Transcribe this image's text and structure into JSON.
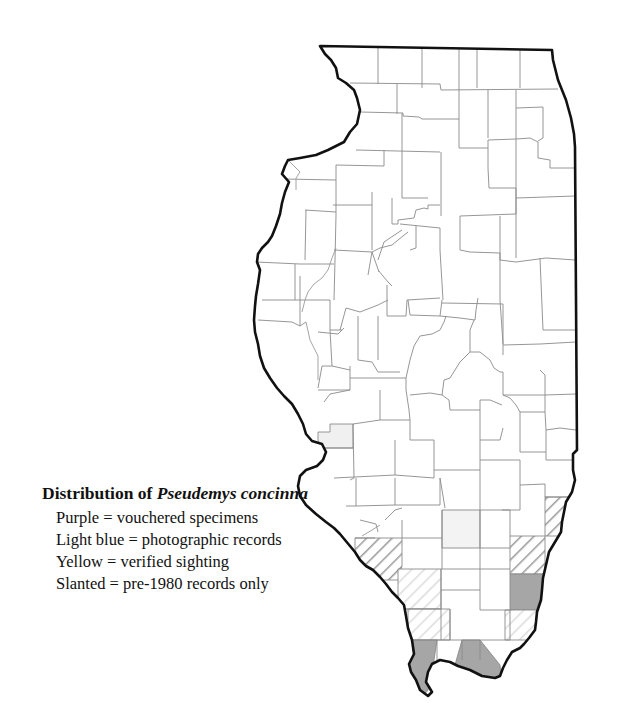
{
  "legend": {
    "title_prefix": "Distribution of ",
    "title_species": "Pseudemys concinna",
    "items": [
      {
        "label": "Purple = vouchered specimens"
      },
      {
        "label": "Light blue = photographic records"
      },
      {
        "label": "Yellow = verified sighting"
      },
      {
        "label": "Slanted = pre-1980 records only"
      }
    ]
  },
  "map": {
    "region": "Illinois",
    "colors": {
      "vouchered": "#a6a6a6",
      "photographic": "#f0f0f0",
      "verified": "#f3f3f3",
      "hatch_dark": "#9a9a9a",
      "hatch_light": "#d6d6d6",
      "border": "#111111",
      "county_line": "#8a8a8a"
    },
    "shaded_counties": [
      {
        "status": "photographic",
        "position": "west-central, Mississippi River"
      },
      {
        "status": "verified",
        "position": "south-central"
      },
      {
        "status": "pre-1980",
        "position": "southeast, Wabash River (north)"
      },
      {
        "status": "pre-1980",
        "position": "southeast, Wabash River"
      },
      {
        "status": "vouchered",
        "position": "southeast, Wabash/Ohio River"
      },
      {
        "status": "pre-1980",
        "position": "southwest, Mississippi River"
      },
      {
        "status": "pre-1980-light",
        "position": "south"
      },
      {
        "status": "pre-1980-light",
        "position": "far south"
      },
      {
        "status": "pre-1980-light",
        "position": "far southeast"
      },
      {
        "status": "vouchered",
        "position": "southern tip west (Alexander)"
      },
      {
        "status": "vouchered",
        "position": "southern tip east (Massac)"
      }
    ]
  }
}
